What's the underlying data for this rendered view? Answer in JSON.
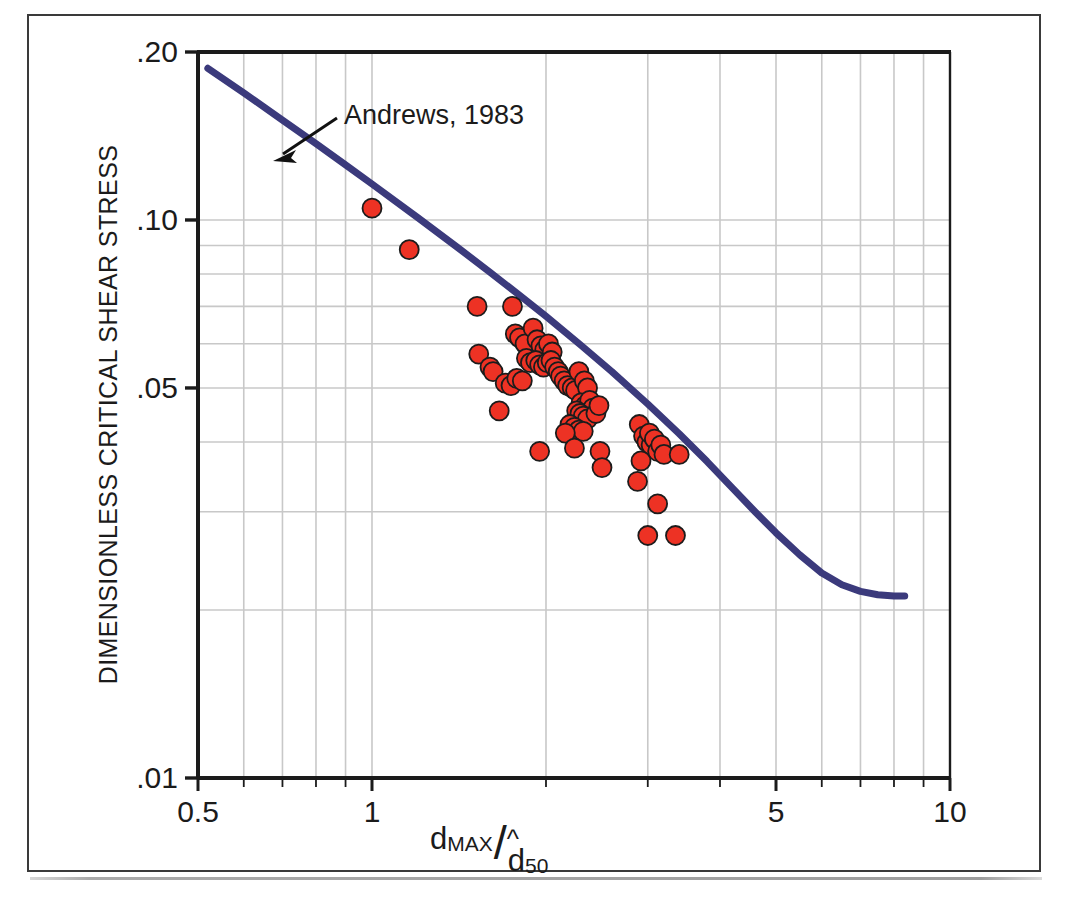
{
  "figure": {
    "type": "scatter-with-fit-curve",
    "border_color": "#3a3a3a",
    "background": "#ffffff"
  },
  "annotation": {
    "text": "Andrews, 1983",
    "arrow": "arrow-pointing-to-curve"
  },
  "axes": {
    "x": {
      "label_parts": {
        "numerator": "d",
        "numerator_sub": "MAX",
        "slash": "/",
        "denominator": "d",
        "denominator_sub": "50",
        "denominator_hat": "^"
      },
      "label_plain": "d_MAX / d-hat_50",
      "scale": "log",
      "min": 0.5,
      "max": 10,
      "tick_labels": [
        "0.5",
        "1",
        "5",
        "10"
      ],
      "tick_values": [
        0.5,
        1,
        5,
        10
      ]
    },
    "y": {
      "label": "DIMENSIONLESS CRITICAL SHEAR STRESS",
      "scale": "log",
      "min": 0.01,
      "max": 0.2,
      "tick_labels": [
        ".20",
        ".10",
        ".05",
        ".01"
      ],
      "tick_values": [
        0.2,
        0.1,
        0.05,
        0.01
      ]
    }
  },
  "colors": {
    "marker_fill": "#ed3224",
    "marker_stroke": "#1c1c1c",
    "curve": "#3b3a7c",
    "grid": "#c8c8c8",
    "axis": "#1b1b1b",
    "text": "#1b1b1b"
  },
  "chart_data": {
    "type": "scatter",
    "title": "",
    "xlabel": "d_MAX / d-hat_50",
    "ylabel": "DIMENSIONLESS CRITICAL SHEAR STRESS",
    "xscale": "log",
    "yscale": "log",
    "xlim": [
      0.5,
      10
    ],
    "ylim": [
      0.01,
      0.2
    ],
    "xticks": [
      0.5,
      1,
      5,
      10
    ],
    "xticklabels": [
      "0.5",
      "1",
      "5",
      "10"
    ],
    "yticks": [
      0.2,
      0.1,
      0.05,
      0.01
    ],
    "yticklabels": [
      ".20",
      ".10",
      ".05",
      ".01"
    ],
    "grid": true,
    "legend": false,
    "annotations": [
      {
        "text": "Andrews, 1983",
        "points_to": "fit-curve",
        "x": 1.0,
        "y": 0.125
      }
    ],
    "series": [
      {
        "name": "observations",
        "type": "scatter",
        "marker": "circle",
        "color": "#ed3224",
        "points": [
          [
            1.0,
            0.105
          ],
          [
            1.16,
            0.0885
          ],
          [
            1.52,
            0.07
          ],
          [
            1.75,
            0.07
          ],
          [
            1.53,
            0.0575
          ],
          [
            1.6,
            0.0545
          ],
          [
            1.62,
            0.0535
          ],
          [
            1.77,
            0.0625
          ],
          [
            1.8,
            0.0615
          ],
          [
            1.84,
            0.06
          ],
          [
            1.9,
            0.064
          ],
          [
            1.93,
            0.061
          ],
          [
            1.96,
            0.0595
          ],
          [
            1.99,
            0.0585
          ],
          [
            2.02,
            0.06
          ],
          [
            2.05,
            0.058
          ],
          [
            1.85,
            0.0565
          ],
          [
            1.88,
            0.0555
          ],
          [
            1.92,
            0.056
          ],
          [
            1.95,
            0.055
          ],
          [
            1.98,
            0.0545
          ],
          [
            2.01,
            0.0555
          ],
          [
            2.04,
            0.056
          ],
          [
            2.07,
            0.0545
          ],
          [
            2.1,
            0.0535
          ],
          [
            1.7,
            0.051
          ],
          [
            1.74,
            0.0505
          ],
          [
            1.78,
            0.052
          ],
          [
            1.82,
            0.0515
          ],
          [
            2.12,
            0.0525
          ],
          [
            2.15,
            0.0515
          ],
          [
            2.18,
            0.0505
          ],
          [
            2.22,
            0.05
          ],
          [
            2.25,
            0.0495
          ],
          [
            2.28,
            0.0535
          ],
          [
            2.33,
            0.0515
          ],
          [
            2.36,
            0.05
          ],
          [
            2.3,
            0.047
          ],
          [
            2.34,
            0.0465
          ],
          [
            2.38,
            0.0475
          ],
          [
            2.41,
            0.046
          ],
          [
            2.26,
            0.0455
          ],
          [
            2.29,
            0.045
          ],
          [
            2.32,
            0.0445
          ],
          [
            2.36,
            0.044
          ],
          [
            2.44,
            0.045
          ],
          [
            2.47,
            0.0465
          ],
          [
            2.2,
            0.043
          ],
          [
            2.24,
            0.0425
          ],
          [
            2.28,
            0.042
          ],
          [
            2.32,
            0.0418
          ],
          [
            2.16,
            0.0415
          ],
          [
            1.66,
            0.0455
          ],
          [
            1.95,
            0.0385
          ],
          [
            2.24,
            0.039
          ],
          [
            2.48,
            0.0385
          ],
          [
            2.5,
            0.036
          ],
          [
            2.9,
            0.043
          ],
          [
            2.95,
            0.041
          ],
          [
            2.99,
            0.04
          ],
          [
            3.04,
            0.0395
          ],
          [
            3.02,
            0.0415
          ],
          [
            3.08,
            0.0405
          ],
          [
            3.12,
            0.0385
          ],
          [
            3.16,
            0.0395
          ],
          [
            3.2,
            0.038
          ],
          [
            2.92,
            0.037
          ],
          [
            3.4,
            0.038
          ],
          [
            2.88,
            0.034
          ],
          [
            3.12,
            0.031
          ],
          [
            3.0,
            0.0272
          ],
          [
            3.35,
            0.0272
          ]
        ]
      },
      {
        "name": "Andrews, 1983 fit curve",
        "type": "line",
        "color": "#3b3a7c",
        "points": [
          [
            0.52,
            0.187
          ],
          [
            0.6,
            0.169
          ],
          [
            0.7,
            0.151
          ],
          [
            0.8,
            0.137
          ],
          [
            0.9,
            0.1255
          ],
          [
            1.0,
            0.116
          ],
          [
            1.2,
            0.101
          ],
          [
            1.4,
            0.0896
          ],
          [
            1.6,
            0.0806
          ],
          [
            1.8,
            0.0733
          ],
          [
            2.0,
            0.0672
          ],
          [
            2.3,
            0.0596
          ],
          [
            2.6,
            0.0535
          ],
          [
            3.0,
            0.0468
          ],
          [
            3.4,
            0.0414
          ],
          [
            3.8,
            0.0369
          ],
          [
            4.2,
            0.0331
          ],
          [
            4.6,
            0.03
          ],
          [
            5.0,
            0.0275
          ],
          [
            5.5,
            0.0251
          ],
          [
            6.0,
            0.0233
          ],
          [
            6.5,
            0.0222
          ],
          [
            7.0,
            0.0216
          ],
          [
            7.5,
            0.0213
          ],
          [
            8.0,
            0.0212
          ],
          [
            8.35,
            0.0212
          ]
        ]
      }
    ]
  }
}
